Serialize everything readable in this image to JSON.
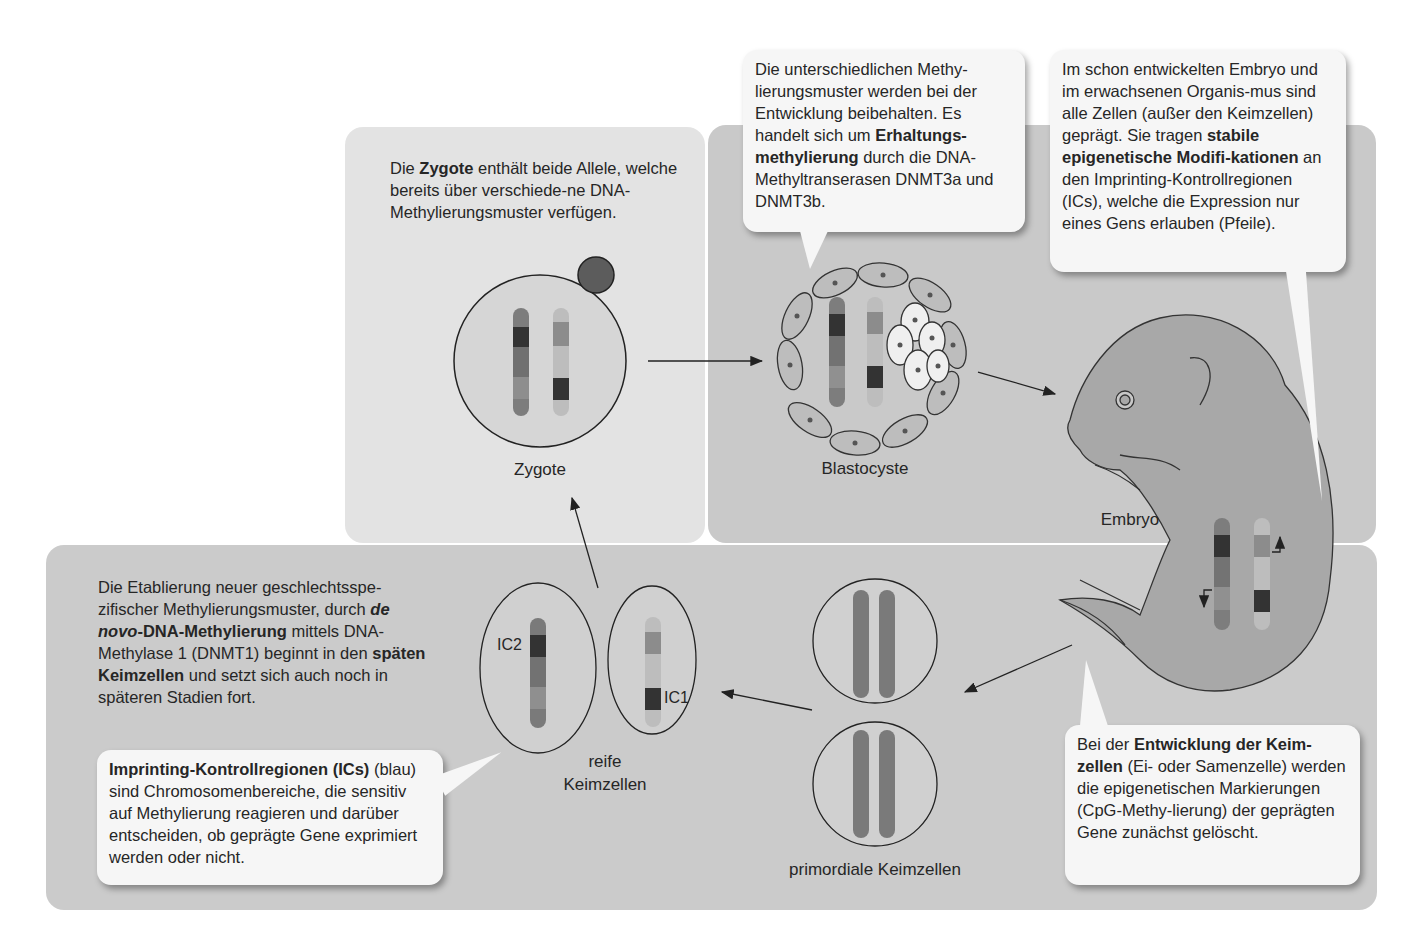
{
  "panels": {
    "zygote": {
      "intro_pre": "Die ",
      "intro_bold": "Zygote",
      "intro_post": " enthält beide Allele, welche bereits über verschiede-ne DNA-Methylierungsmuster verfügen.",
      "label": "Zygote"
    },
    "blastocyst": {
      "label": "Blastocyste",
      "bubble_pre": "Die unterschiedlichen Methy-lierungsmuster werden bei der Entwicklung beibehalten. Es handelt sich um ",
      "bubble_bold": "Erhaltungs-methylierung",
      "bubble_post": " durch die DNA-Methyltranserasen DNMT3a und DNMT3b."
    },
    "embryo": {
      "label": "Embryo",
      "bubble_pre": "Im schon entwickelten Embryo und im erwachsenen Organis-mus sind alle Zellen (außer den Keimzellen) geprägt. Sie tragen ",
      "bubble_bold": "stabile epigenetische Modifi-kationen",
      "bubble_post": " an den Imprinting-Kontrollregionen (ICs), welche die Expression nur eines Gens erlauben (Pfeile)."
    },
    "germ": {
      "intro_pre": "Die Etablierung neuer geschlechtsspe-zifischer Methylierungsmuster, durch ",
      "intro_bold_italic": "de novo",
      "intro_bold": "-DNA-Methylierung",
      "intro_mid": " mittels DNA-Methylase 1 (DNMT1) beginnt in den ",
      "intro_bold2": "späten Keimzellen",
      "intro_post": " und setzt sich auch noch in späteren Stadien fort.",
      "ic_bubble_bold": "Imprinting-Kontrollregionen (ICs)",
      "ic_bubble_post": " (blau) sind Chromosomenbereiche, die sensitiv auf Methylierung reagieren und darüber entscheiden, ob geprägte Gene exprimiert werden oder nicht.",
      "mature_label_1": "reife",
      "mature_label_2": "Keimzellen",
      "ic1": "IC1",
      "ic2": "IC2",
      "primordial_label": "primordiale Keimzellen",
      "dev_bubble_pre": "Bei der ",
      "dev_bubble_bold": "Entwicklung der Keim-zellen",
      "dev_bubble_post": " (Ei- oder Samenzelle) werden die epigenetischen Markierungen (CpG-Methy-lierung) der geprägten Gene zunächst gelöscht."
    }
  },
  "colors": {
    "panel_light": "#e3e3e3",
    "panel_mid": "#c9c9c9",
    "bubble": "#f6f6f6",
    "chrom_dark": "#3a3a3a",
    "chrom_mid": "#7a7a7a",
    "chrom_light": "#b0b0b0"
  }
}
